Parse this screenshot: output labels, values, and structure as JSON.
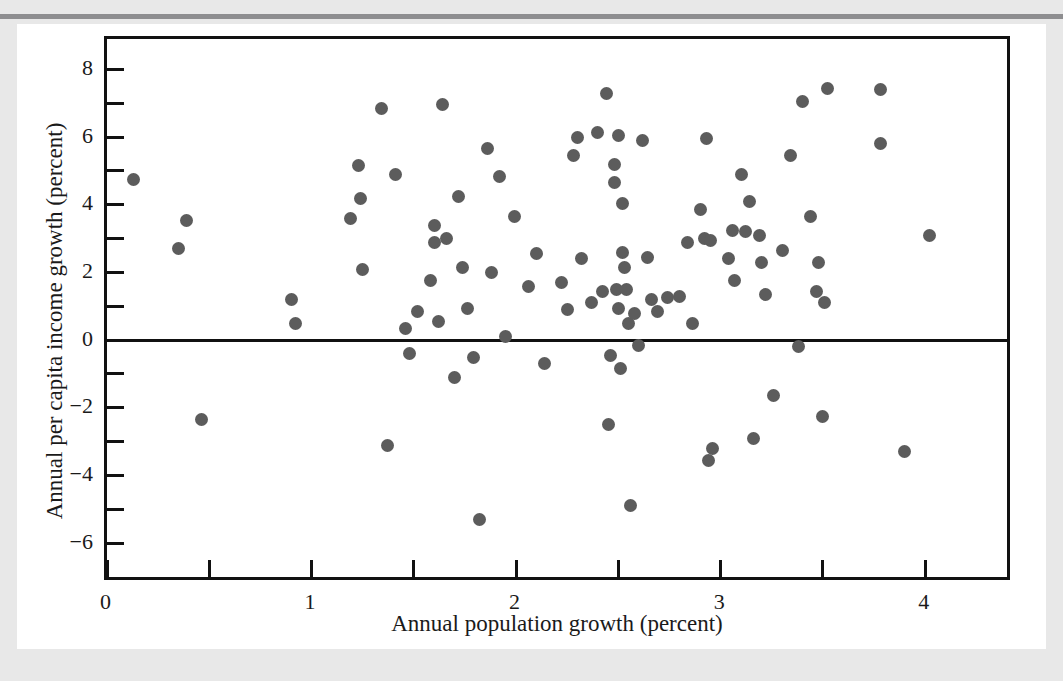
{
  "figure": {
    "background_color": "#e8e8e8",
    "paper_color": "#ffffff",
    "rule_color": "#8e8e90",
    "dot_color": "#5c5c5c",
    "axis_color": "#111111"
  },
  "chart_data": {
    "type": "scatter",
    "title": "",
    "xlabel": "Annual population growth (percent)",
    "ylabel": "Annual per capita income growth (percent)",
    "xlim": [
      0.0,
      4.4
    ],
    "ylim": [
      -7.0,
      8.9
    ],
    "grid": false,
    "legend": null,
    "zero_reference_line": 0,
    "x_ticks_major": [
      0,
      1,
      2,
      3,
      4
    ],
    "x_tick_labels": [
      "0",
      "1",
      "2",
      "3",
      "4"
    ],
    "x_ticks_minor": [
      0.5,
      1.5,
      2.5,
      3.5
    ],
    "y_ticks_major": [
      -6,
      -4,
      -2,
      0,
      2,
      4,
      6,
      8
    ],
    "y_tick_labels": [
      "−6",
      "−4",
      "−2",
      "0",
      "2",
      "4",
      "6",
      "8"
    ],
    "y_ticks_minor": [
      -5,
      -3,
      -1,
      1,
      3,
      5,
      7
    ],
    "n_points": 118,
    "points": [
      [
        0.13,
        4.75
      ],
      [
        0.35,
        2.7
      ],
      [
        0.39,
        3.55
      ],
      [
        0.46,
        -2.35
      ],
      [
        0.9,
        1.2
      ],
      [
        0.92,
        0.5
      ],
      [
        1.19,
        3.6
      ],
      [
        1.23,
        5.15
      ],
      [
        1.24,
        4.2
      ],
      [
        1.25,
        2.1
      ],
      [
        1.34,
        6.85
      ],
      [
        1.37,
        -3.1
      ],
      [
        1.41,
        4.9
      ],
      [
        1.46,
        0.35
      ],
      [
        1.48,
        -0.4
      ],
      [
        1.52,
        0.85
      ],
      [
        1.58,
        1.75
      ],
      [
        1.6,
        3.4
      ],
      [
        1.6,
        2.9
      ],
      [
        1.62,
        0.55
      ],
      [
        1.64,
        6.95
      ],
      [
        1.66,
        3.0
      ],
      [
        1.7,
        -1.1
      ],
      [
        1.72,
        4.25
      ],
      [
        1.74,
        2.15
      ],
      [
        1.76,
        0.95
      ],
      [
        1.79,
        -0.5
      ],
      [
        1.82,
        -5.3
      ],
      [
        1.86,
        5.65
      ],
      [
        1.88,
        2.0
      ],
      [
        1.92,
        4.85
      ],
      [
        1.95,
        0.1
      ],
      [
        1.99,
        3.65
      ],
      [
        2.06,
        1.6
      ],
      [
        2.1,
        2.55
      ],
      [
        2.14,
        -0.7
      ],
      [
        2.22,
        1.7
      ],
      [
        2.25,
        0.9
      ],
      [
        2.28,
        5.45
      ],
      [
        2.3,
        6.0
      ],
      [
        2.32,
        2.4
      ],
      [
        2.37,
        1.1
      ],
      [
        2.4,
        6.15
      ],
      [
        2.42,
        1.45
      ],
      [
        2.44,
        7.3
      ],
      [
        2.45,
        -2.5
      ],
      [
        2.46,
        -0.45
      ],
      [
        2.48,
        5.2
      ],
      [
        2.48,
        4.65
      ],
      [
        2.49,
        1.5
      ],
      [
        2.5,
        0.95
      ],
      [
        2.5,
        6.05
      ],
      [
        2.51,
        -0.85
      ],
      [
        2.52,
        2.6
      ],
      [
        2.52,
        4.05
      ],
      [
        2.53,
        2.15
      ],
      [
        2.54,
        1.5
      ],
      [
        2.55,
        0.5
      ],
      [
        2.56,
        -4.9
      ],
      [
        2.58,
        0.8
      ],
      [
        2.6,
        -0.15
      ],
      [
        2.62,
        5.9
      ],
      [
        2.64,
        2.45
      ],
      [
        2.66,
        1.2
      ],
      [
        2.69,
        0.85
      ],
      [
        2.74,
        1.25
      ],
      [
        2.8,
        1.3
      ],
      [
        2.84,
        2.9
      ],
      [
        2.86,
        0.5
      ],
      [
        2.9,
        3.85
      ],
      [
        2.92,
        3.0
      ],
      [
        2.93,
        5.95
      ],
      [
        2.94,
        -3.55
      ],
      [
        2.95,
        2.95
      ],
      [
        2.96,
        -3.2
      ],
      [
        3.04,
        2.4
      ],
      [
        3.06,
        3.25
      ],
      [
        3.07,
        1.75
      ],
      [
        3.1,
        4.9
      ],
      [
        3.12,
        3.2
      ],
      [
        3.14,
        4.1
      ],
      [
        3.16,
        -2.9
      ],
      [
        3.19,
        3.1
      ],
      [
        3.2,
        2.3
      ],
      [
        3.22,
        1.35
      ],
      [
        3.26,
        -1.65
      ],
      [
        3.3,
        2.65
      ],
      [
        3.34,
        5.45
      ],
      [
        3.38,
        -0.2
      ],
      [
        3.4,
        7.05
      ],
      [
        3.44,
        3.65
      ],
      [
        3.47,
        1.45
      ],
      [
        3.48,
        2.3
      ],
      [
        3.5,
        -2.25
      ],
      [
        3.51,
        1.1
      ],
      [
        3.52,
        7.45
      ],
      [
        3.78,
        7.4
      ],
      [
        3.78,
        5.8
      ],
      [
        3.9,
        -3.3
      ],
      [
        4.02,
        3.1
      ]
    ]
  }
}
